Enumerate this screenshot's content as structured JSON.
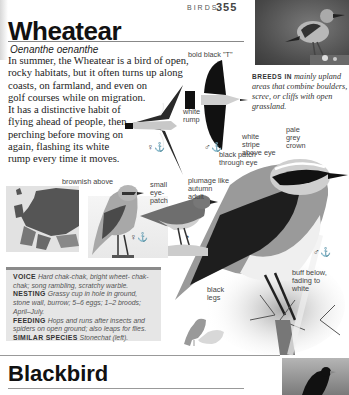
{
  "header": {
    "section": "BIRDS",
    "page_number": "355"
  },
  "species": {
    "common_name": "Wheatear",
    "latin_name": "Oenanthe oenanthe",
    "description_lines": [
      "In summer, the Wheatear is a bird of open,",
      "rocky habitats, but it often turns up along",
      "coasts, on farmland, and even on",
      "golf courses while on migration.",
      "It has a distinctive habit of",
      "flying ahead of people, then",
      "perching before moving on",
      "again, flashing its white",
      "rump every time it moves."
    ],
    "breeds": {
      "label": "BREEDS IN",
      "text": "mainly upland areas that combine boulders, scree, or cliffs with open grassland."
    }
  },
  "annotations": {
    "bold_black_t": "bold black \"T\"",
    "white_rump": "white rump",
    "white_stripe": "white stripe above eye",
    "pale_grey_crown": "pale grey crown",
    "black_patch": "black patch through eye",
    "brownish_above": "brownish above",
    "small_eye_patch": "small eye-patch",
    "plumage_autumn": "plumage like autumn adult",
    "buff_below": "buff below, fading to white",
    "black_legs": "black legs"
  },
  "sex_symbols": {
    "female_flight": "♀⚓",
    "male_flight": "♂⚓",
    "female_perched": "♀⚓",
    "juvenile": "◔",
    "male_main": "♂⚓"
  },
  "info_box": {
    "voice_label": "VOICE",
    "voice": "Hard chak-chak, bright wheet- chak-chak; song rambling, scratchy warble.",
    "nesting_label": "NESTING",
    "nesting": "Grassy cup in hole in ground, stone wall, burrow; 5–6 eggs; 1–2 broods; April–July.",
    "feeding_label": "FEEDING",
    "feeding": "Hops and runs after insects and spiders on open ground; also leaps for flies.",
    "similar_label": "SIMILAR SPECIES",
    "similar": "Stonechat (left)."
  },
  "next_section": {
    "common_name": "Blackbird"
  },
  "colors": {
    "text": "#222222",
    "info_box_bg": "#e6e6e6",
    "info_box_rule": "#8a8a8a",
    "rule": "#888888"
  }
}
